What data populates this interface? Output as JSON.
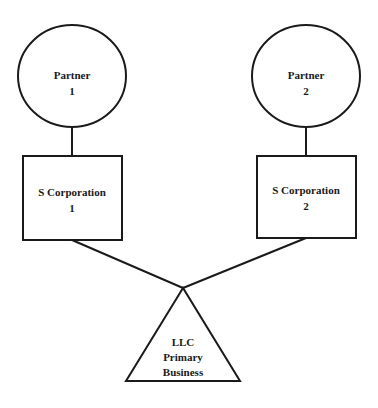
{
  "diagram": {
    "type": "ownership-structure",
    "nodes": [
      {
        "id": "partner1",
        "shape": "circle",
        "line1": "Partner",
        "line2": "1"
      },
      {
        "id": "partner2",
        "shape": "circle",
        "line1": "Partner",
        "line2": "2"
      },
      {
        "id": "scorp1",
        "shape": "rectangle",
        "line1": "S Corporation",
        "line2": "1"
      },
      {
        "id": "scorp2",
        "shape": "rectangle",
        "line1": "S Corporation",
        "line2": "2"
      },
      {
        "id": "llc",
        "shape": "triangle",
        "line1": "LLC",
        "line2": "Primary",
        "line3": "Business"
      }
    ],
    "edges": [
      {
        "from": "partner1",
        "to": "scorp1"
      },
      {
        "from": "partner2",
        "to": "scorp2"
      },
      {
        "from": "scorp1",
        "to": "llc"
      },
      {
        "from": "scorp2",
        "to": "llc"
      }
    ],
    "colors": {
      "stroke": "#1a1a1a",
      "fill": "#ffffff",
      "background": "#ffffff"
    }
  }
}
